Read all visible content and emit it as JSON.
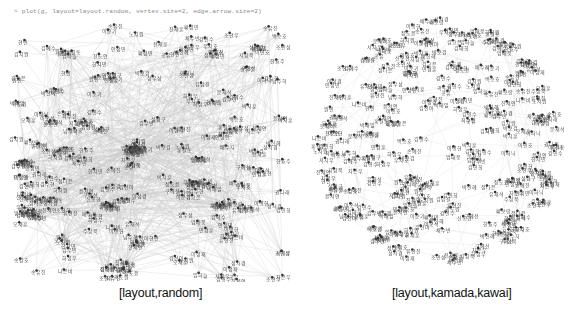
{
  "console": {
    "command": "> plot(g, layout=layout.random, vertex.size=2, edge.arrow.size=2)"
  },
  "plots": [
    {
      "id": "random",
      "caption": "[layout,random]",
      "layout": "random",
      "bounds": {
        "x": 15,
        "y": 8,
        "w": 270,
        "h": 258
      },
      "edge_color": "#c8c8c8",
      "edge_alpha": 0.55,
      "edge_count": 900,
      "vertex_color": "#333333",
      "label_color": "#555555"
    },
    {
      "id": "kamada-kawai",
      "caption": "[layout,kamada,kawai]",
      "layout": "kamada.kawai",
      "bounds": {
        "cx": 139,
        "cy": 130,
        "r": 122
      },
      "edge_color": "#d8d8d8",
      "edge_alpha": 0.5,
      "edge_count": 260,
      "vertex_color": "#333333",
      "label_color": "#555555"
    }
  ],
  "graph": {
    "vertex_count": 330,
    "vertex_size": 2,
    "edge_arrow_size": 2,
    "labels": [
      "김영수",
      "이민호",
      "박지훈",
      "최수진",
      "정다은",
      "강민수",
      "조현우",
      "윤서연",
      "장도윤",
      "임하늘",
      "한지민",
      "오세훈",
      "서지우",
      "신동현",
      "권나래",
      "황보람",
      "안성민",
      "송유진",
      "전재훈",
      "홍길동",
      "나은비",
      "류현진",
      "문재석",
      "배수지",
      "백승호",
      "유재석",
      "노지원",
      "하정우",
      "곽도원",
      "성시경",
      "차은우",
      "주상욱",
      "우지호",
      "구혜선",
      "민경훈",
      "진세연",
      "지창욱",
      "엄태웅",
      "채수빈",
      "원빈",
      "김태희",
      "이준기",
      "박보검",
      "김수현",
      "이종석",
      "박신혜",
      "김지원",
      "이성경",
      "남주혁",
      "김우빈",
      "이하늬",
      "김고은",
      "이병헌",
      "송강호",
      "김혜수",
      "전도연",
      "박해일",
      "설경구",
      "황정민",
      "조인성",
      "김남길",
      "이정재",
      "정우성",
      "손예진",
      "한효주",
      "김민희",
      "공유",
      "현빈",
      "하지원",
      "김선아"
    ]
  }
}
